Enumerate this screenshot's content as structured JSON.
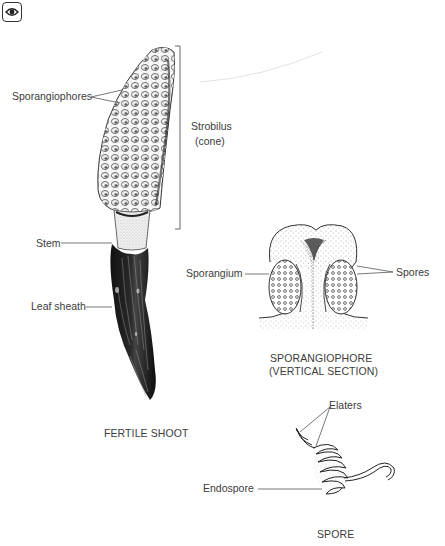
{
  "toolbar": {
    "view_icon": "eye-icon"
  },
  "diagram": {
    "fertile_shoot": {
      "caption": "FERTILE SHOOT",
      "labels": {
        "sporangiophores": "Sporangiophores",
        "strobilus": "Strobilus",
        "strobilus_sub": "(cone)",
        "stem": "Stem",
        "leaf_sheath": "Leaf sheath"
      }
    },
    "sporangiophore": {
      "caption_line1": "SPORANGIOPHORE",
      "caption_line2": "(VERTICAL SECTION)",
      "labels": {
        "sporangium": "Sporangium",
        "spores": "Spores"
      }
    },
    "spore": {
      "caption": "SPORE",
      "labels": {
        "elaters": "Elaters",
        "endospore": "Endospore"
      }
    }
  },
  "colors": {
    "ink": "#1a1a1a",
    "label_text": "#3c3c3c",
    "leader_line": "#555555",
    "background": "#ffffff"
  }
}
